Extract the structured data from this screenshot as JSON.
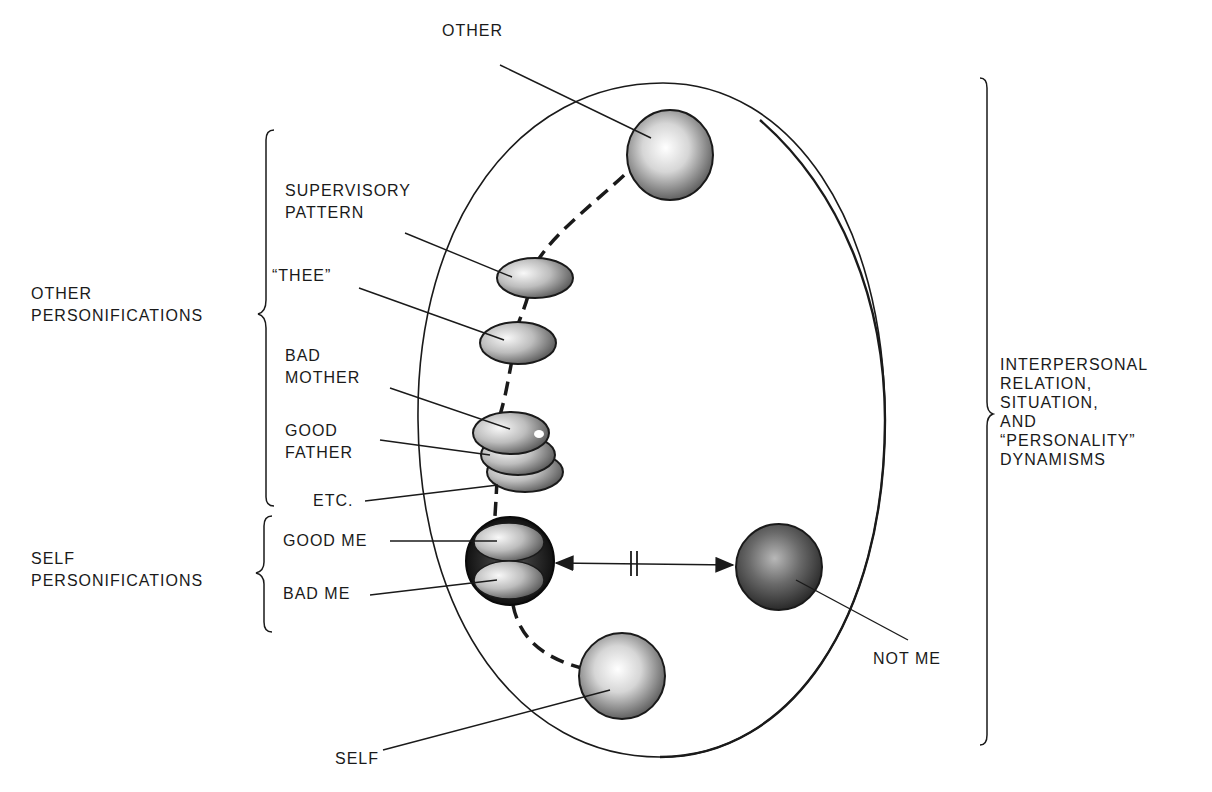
{
  "diagram": {
    "outer_ellipse_label": "Interpersonal field",
    "labels": {
      "other": "OTHER",
      "supervisory_pattern": "SUPERVISORY\nPATTERN",
      "thee": "“THEE”",
      "bad_mother": "BAD\nMOTHER",
      "good_father": "GOOD\nFATHER",
      "etc": "ETC.",
      "good_me": "GOOD ME",
      "bad_me": "BAD ME",
      "self": "SELF",
      "not_me": "NOT ME",
      "other_personifications": "OTHER\nPERSONIFICATIONS",
      "self_personifications": "SELF\nPERSONIFICATIONS",
      "dynamisms": "INTERPERSONAL\nRELATION,\nSITUATION,\nAND\n“PERSONALITY”\nDYNAMISMS"
    },
    "connector": {
      "between": [
        "self_personifications",
        "not_me"
      ],
      "symbol": "broken double-headed arrow (||)"
    },
    "colors": {
      "ink": "#1a1a1a",
      "sphere_light": "#f4f4f4",
      "sphere_mid": "#9a9a9a",
      "sphere_dark": "#3a3a3a"
    }
  }
}
